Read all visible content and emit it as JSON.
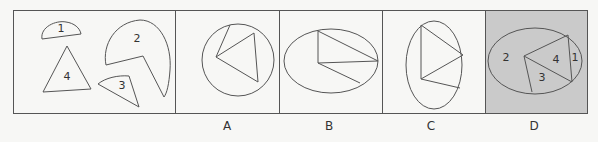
{
  "question": {
    "pieces": [
      "1",
      "2",
      "3",
      "4"
    ],
    "options": [
      {
        "label": "A",
        "shape": "circle"
      },
      {
        "label": "B",
        "shape": "ellipse-horizontal"
      },
      {
        "label": "C",
        "shape": "ellipse-vertical"
      },
      {
        "label": "D",
        "shape": "ellipse-horizontal",
        "highlighted": true,
        "piece_labels": [
          "2",
          "4",
          "3",
          "1"
        ]
      }
    ],
    "highlight_color": "#c9c9c9",
    "line_color": "#555555"
  }
}
